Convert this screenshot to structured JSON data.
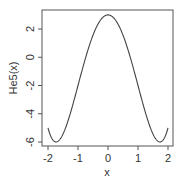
{
  "chart_data": {
    "type": "line",
    "title": "",
    "xlabel": "x",
    "ylabel": "He5(x)",
    "xlim": [
      -2.1,
      2.1
    ],
    "ylim": [
      -6.2,
      3.4
    ],
    "xticks": [
      -2,
      -1,
      0,
      1,
      2
    ],
    "yticks": [
      -6,
      -4,
      -2,
      0,
      2
    ],
    "xtick_labels": [
      "-2",
      "-1",
      "0",
      "1",
      "2"
    ],
    "ytick_labels": [
      "-6",
      "-4",
      "-2",
      "0",
      "2"
    ],
    "grid": false,
    "legend": null,
    "series": [
      {
        "name": "He5(x)",
        "color": "#444444",
        "x": [
          -2.0,
          -1.9,
          -1.8,
          -1.732,
          -1.6,
          -1.4,
          -1.2,
          -1.0,
          -0.8,
          -0.6,
          -0.4,
          -0.2,
          0.0,
          0.2,
          0.4,
          0.6,
          0.8,
          1.0,
          1.2,
          1.4,
          1.6,
          1.732,
          1.8,
          1.9,
          2.0
        ],
        "y": [
          -5.0,
          -5.63,
          -5.94,
          -6.0,
          -5.81,
          -4.92,
          -3.57,
          -2.0,
          -0.43,
          1.0,
          2.1,
          2.76,
          3.0,
          2.76,
          2.1,
          1.0,
          -0.43,
          -2.0,
          -3.57,
          -4.92,
          -5.81,
          -6.0,
          -5.94,
          -5.63,
          -5.0
        ]
      }
    ]
  }
}
